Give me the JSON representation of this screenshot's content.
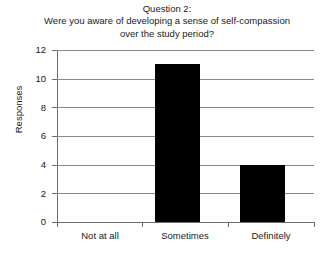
{
  "chart_data": {
    "type": "bar",
    "title": "Question 2:\nWere you aware of developing a sense of self-compassion\nover the study period?",
    "title_lines": [
      "Question 2:",
      "Were you aware of developing a sense of self-compassion",
      "over the study period?"
    ],
    "categories": [
      "Not at all",
      "Sometimes",
      "Definitely"
    ],
    "values": [
      0,
      11,
      4
    ],
    "xlabel": "",
    "ylabel": "Responses",
    "ylim": [
      0,
      12
    ],
    "yticks": [
      0,
      2,
      4,
      6,
      8,
      10,
      12
    ],
    "ytick_labels": [
      "0",
      "2",
      "4",
      "6",
      "8",
      "10",
      "12"
    ],
    "grid": true,
    "grid_axis": "y",
    "legend": false,
    "bar_color": "#000000",
    "grid_color": "#8a8a8a",
    "axis_color": "#6e6e6e",
    "background_color": "#ffffff",
    "text_color": "#1a1a1a"
  }
}
